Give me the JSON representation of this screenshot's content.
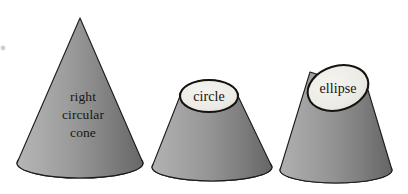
{
  "figure": {
    "background_color": "#ffffff",
    "outline_color": "#1d1a17",
    "shapes": [
      {
        "id": "full-cone",
        "name": "right-circular-cone",
        "kind": "cone",
        "label_lines": [
          "right",
          "circular",
          "cone"
        ],
        "apex": {
          "x": 80,
          "y": 18
        },
        "base_center": {
          "x": 80,
          "y": 163
        },
        "base_rx": 63,
        "base_ry": 15,
        "fill_light": "#a9a9a9",
        "fill_dark": "#6e6e6e"
      },
      {
        "id": "circle-cone",
        "name": "truncated-cone-circle",
        "kind": "truncated-cone",
        "section_label": "circle",
        "section_type": "circle",
        "section_center": {
          "x": 209,
          "y": 96
        },
        "section_rx": 29,
        "section_ry": 16,
        "section_rotation_deg": 0,
        "section_fill": "#eceae5",
        "base_center": {
          "x": 212,
          "y": 167
        },
        "base_rx": 60,
        "base_ry": 14,
        "fill_light": "#a5a5a5",
        "fill_dark": "#696969"
      },
      {
        "id": "ellipse-cone",
        "name": "truncated-cone-ellipse",
        "kind": "truncated-cone",
        "section_label": "ellipse",
        "section_type": "ellipse",
        "section_center": {
          "x": 338,
          "y": 88
        },
        "section_rx": 31,
        "section_ry": 22,
        "section_rotation_deg": -17,
        "section_fill": "#eceae5",
        "base_center": {
          "x": 336,
          "y": 170
        },
        "base_rx": 56,
        "base_ry": 13,
        "fill_light": "#a5a5a5",
        "fill_dark": "#6a6a6a"
      }
    ]
  }
}
